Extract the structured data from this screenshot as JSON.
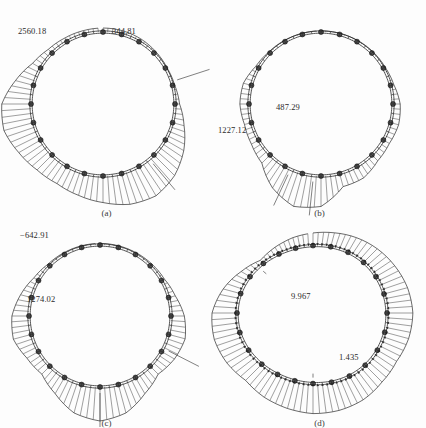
{
  "figure": {
    "scan_header_remnant": "",
    "background_color": "#fdfdfd",
    "ink_color": "#2b2b2b",
    "node_color": "#2a2a2a",
    "panels": [
      {
        "id": "a",
        "caption": "(a)",
        "labels": [
          {
            "text": "2560.18",
            "x": 18,
            "y": 18
          },
          {
            "text": "344.81",
            "x": 112,
            "y": 18
          }
        ]
      },
      {
        "id": "b",
        "caption": "(b)",
        "labels": [
          {
            "text": "487.29",
            "x": 63,
            "y": 94
          },
          {
            "text": "1227.12",
            "x": 5,
            "y": 117
          }
        ]
      },
      {
        "id": "c",
        "caption": "(c)",
        "labels": [
          {
            "text": "−642.91",
            "x": 20,
            "y": 12
          },
          {
            "text": "1274.02",
            "x": 27,
            "y": 76
          }
        ]
      },
      {
        "id": "d",
        "caption": "(d)",
        "labels": [
          {
            "text": "9.967",
            "x": 78,
            "y": 73
          },
          {
            "text": "1.435",
            "x": 126,
            "y": 134
          }
        ]
      }
    ]
  },
  "chart_data": [
    {
      "type": "line",
      "id": "a",
      "title": "(a)",
      "plot_kind": "radial-hatched-distribution-on-circular-ring",
      "xlabel": "",
      "ylabel": "",
      "legend": [],
      "grid": false,
      "ring": {
        "center_x": 103,
        "center_y": 96,
        "radius": 72,
        "segments": 24,
        "nodes": 24
      },
      "annotations": [
        {
          "text": "2560.18",
          "angle_deg": 140,
          "value": 2560.18,
          "side": "outward"
        },
        {
          "text": "344.81",
          "angle_deg": 72,
          "value": 344.81,
          "side": "outward"
        }
      ],
      "categories": [
        0,
        15,
        30,
        45,
        60,
        75,
        90,
        105,
        120,
        135,
        150,
        165,
        180,
        195,
        210,
        225,
        240,
        255,
        270,
        285,
        300,
        315,
        330,
        345
      ],
      "values": [
        300,
        290,
        250,
        180,
        120,
        160,
        344.81,
        900,
        1600,
        2200,
        2560.18,
        2400,
        2000,
        1700,
        1500,
        1600,
        1900,
        2300,
        2200,
        1400,
        700,
        400,
        320,
        300
      ],
      "ylim": [
        0,
        2560.18
      ]
    },
    {
      "type": "line",
      "id": "b",
      "title": "(b)",
      "plot_kind": "radial-hatched-distribution-on-circular-ring",
      "xlabel": "",
      "ylabel": "",
      "legend": [],
      "grid": false,
      "ring": {
        "center_x": 108,
        "center_y": 96,
        "radius": 72,
        "segments": 24,
        "nodes": 24
      },
      "annotations": [
        {
          "text": "487.29",
          "angle_deg": 186,
          "value": 487.29,
          "side": "outward"
        },
        {
          "text": "1227.12",
          "angle_deg": 205,
          "value": 1227.12,
          "side": "outward"
        }
      ],
      "categories": [
        0,
        15,
        30,
        45,
        60,
        75,
        90,
        105,
        120,
        135,
        150,
        165,
        180,
        195,
        210,
        225,
        240,
        255,
        270,
        285,
        300,
        315,
        330,
        345
      ],
      "values": [
        40,
        40,
        50,
        60,
        70,
        120,
        260,
        300,
        250,
        300,
        480,
        487.29,
        1100,
        1227.12,
        900,
        420,
        300,
        260,
        330,
        300,
        120,
        60,
        50,
        40
      ],
      "ylim": [
        0,
        1227.12
      ]
    },
    {
      "type": "line",
      "id": "c",
      "title": "(c)",
      "plot_kind": "radial-hatched-distribution-on-circular-ring",
      "xlabel": "",
      "ylabel": "",
      "legend": [],
      "grid": false,
      "ring": {
        "center_x": 100,
        "center_y": 98,
        "radius": 71,
        "segments": 24,
        "nodes": 24
      },
      "annotations": [
        {
          "text": "−642.91",
          "angle_deg": 117,
          "value": -642.91,
          "side": "outward"
        },
        {
          "text": "1274.02",
          "angle_deg": 180,
          "value": 1274.02,
          "side": "outward"
        }
      ],
      "categories": [
        0,
        15,
        30,
        45,
        60,
        75,
        90,
        105,
        120,
        135,
        150,
        165,
        180,
        195,
        210,
        225,
        240,
        255,
        270,
        285,
        300,
        315,
        330,
        345
      ],
      "values": [
        60,
        60,
        70,
        90,
        120,
        260,
        500,
        642.91,
        560,
        420,
        700,
        1100,
        1274.02,
        1100,
        700,
        420,
        500,
        700,
        640,
        420,
        200,
        90,
        70,
        60
      ],
      "ylim": [
        -642.91,
        1274.02
      ]
    },
    {
      "type": "line",
      "id": "d",
      "title": "(d)",
      "plot_kind": "radial-displacement-vector-field-on-deformed-ring",
      "xlabel": "",
      "ylabel": "",
      "legend": [],
      "grid": false,
      "ring": {
        "center_x": 100,
        "center_y": 95,
        "radius": 72,
        "segments": 24,
        "nodes": 24
      },
      "annotations": [
        {
          "text": "9.967",
          "angle_deg": 180,
          "value": 9.967,
          "side": "inward"
        },
        {
          "text": "1.435",
          "angle_deg": 310,
          "value": 1.435,
          "side": "inward"
        }
      ],
      "categories": [
        0,
        15,
        30,
        45,
        60,
        75,
        90,
        105,
        120,
        135,
        150,
        165,
        180,
        195,
        210,
        225,
        240,
        255,
        270,
        285,
        300,
        315,
        330,
        345
      ],
      "values": [
        4.2,
        4.8,
        5.6,
        6.4,
        7.2,
        8.1,
        8.6,
        8.2,
        7.4,
        7.9,
        9.1,
        9.7,
        9.967,
        9.5,
        8.8,
        7.6,
        8.4,
        8.8,
        8.3,
        6.0,
        3.4,
        1.435,
        2.6,
        3.6
      ],
      "ylim": [
        0,
        9.967
      ]
    }
  ]
}
